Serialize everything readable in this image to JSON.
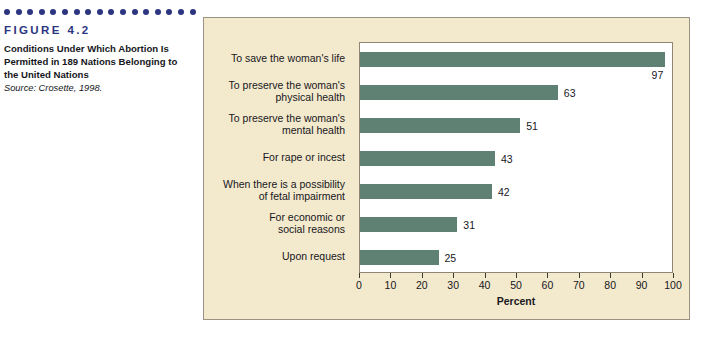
{
  "figure": {
    "dot_count": 17,
    "label": "FIGURE 4.2",
    "title": "Conditions Under Which Abortion Is Permitted in 189 Nations Belonging to the United Nations",
    "source": "Source: Crosette, 1998.",
    "dot_color": "#2b3580",
    "label_color": "#2b3580"
  },
  "panel": {
    "background": "#f3e9cd",
    "border_color": "#9a9384",
    "plot_background": "#ffffff"
  },
  "chart_data": {
    "type": "bar",
    "orientation": "horizontal",
    "title": "",
    "xlabel": "Percent",
    "ylabel": "",
    "xlim": [
      0,
      100
    ],
    "xticks": [
      0,
      10,
      20,
      30,
      40,
      50,
      60,
      70,
      80,
      90,
      100
    ],
    "grid": false,
    "legend": false,
    "bar_color": "#5f8174",
    "categories": [
      "To save the woman's life",
      "To preserve the woman's physical health",
      "To preserve the woman's mental health",
      "For rape or incest",
      "When there is a possibility of fetal impairment",
      "For economic or social reasons",
      "Upon request"
    ],
    "category_lines": [
      [
        "To save the woman's life"
      ],
      [
        "To preserve the woman's",
        "physical health"
      ],
      [
        "To preserve the woman's",
        "mental health"
      ],
      [
        "For rape or incest"
      ],
      [
        "When there is a possibility",
        "of fetal impairment"
      ],
      [
        "For economic or",
        "social reasons"
      ],
      [
        "Upon request"
      ]
    ],
    "values": [
      97,
      63,
      51,
      43,
      42,
      31,
      25
    ],
    "value_labels": [
      "97",
      "63",
      "51",
      "43",
      "42",
      "31",
      "25"
    ]
  }
}
